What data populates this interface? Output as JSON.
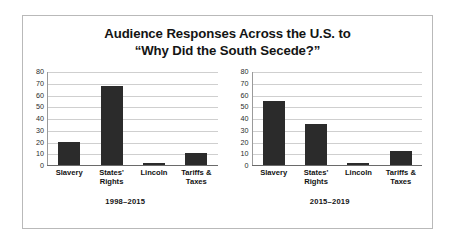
{
  "figure": {
    "title_line_1": "Audience Responses Across the U.S. to",
    "title_line_2": "“Why Did the South Secede?”"
  },
  "chart_data": [
    {
      "type": "bar",
      "title": "1998–2015",
      "categories": [
        "Slavery",
        "States' Rights",
        "Lincoln",
        "Tariffs & Taxes"
      ],
      "category_lines": [
        [
          "Slavery"
        ],
        [
          "States'",
          "Rights"
        ],
        [
          "Lincoln"
        ],
        [
          "Tariffs &",
          "Taxes"
        ]
      ],
      "values": [
        20,
        68,
        2,
        10
      ],
      "xlabel": "",
      "ylabel": "",
      "ylim": [
        0,
        80
      ],
      "yticks": [
        0,
        10,
        20,
        30,
        40,
        50,
        60,
        70,
        80
      ],
      "ytick_labels": [
        "0",
        "10",
        "20",
        "30",
        "40",
        "50",
        "60",
        "70",
        "80"
      ],
      "grid": true,
      "legend": "none",
      "bar_color": "#2b2b2b"
    },
    {
      "type": "bar",
      "title": "2015–2019",
      "categories": [
        "Slavery",
        "States' Rights",
        "Lincoln",
        "Tariffs & Taxes"
      ],
      "category_lines": [
        [
          "Slavery"
        ],
        [
          "States'",
          "Rights"
        ],
        [
          "Lincoln"
        ],
        [
          "Tariffs &",
          "Taxes"
        ]
      ],
      "values": [
        55,
        35,
        2,
        12
      ],
      "xlabel": "",
      "ylabel": "",
      "ylim": [
        0,
        80
      ],
      "yticks": [
        0,
        10,
        20,
        30,
        40,
        50,
        60,
        70,
        80
      ],
      "ytick_labels": [
        "0",
        "10",
        "20",
        "30",
        "40",
        "50",
        "60",
        "70",
        "80"
      ],
      "grid": true,
      "legend": "none",
      "bar_color": "#2b2b2b"
    }
  ],
  "colors": {
    "bar": "#2b2b2b",
    "gridline": "#cfcfcf",
    "axis": "#6a6a6a",
    "border": "#b9b9b9",
    "background": "#ffffff",
    "text": "#141414"
  }
}
